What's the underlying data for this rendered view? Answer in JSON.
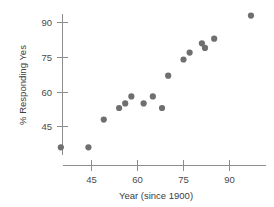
{
  "chart_data": {
    "type": "scatter",
    "title": "",
    "xlabel": "Year (since 1900)",
    "ylabel": "% Responding Yes",
    "xticks": [
      45,
      60,
      75,
      90
    ],
    "yticks": [
      45,
      60,
      75,
      90
    ],
    "xlim": [
      30,
      100
    ],
    "ylim": [
      30,
      97
    ],
    "grid": false,
    "legend": "none",
    "marker_color": "#6f6f6f",
    "axis_color": "#8d8d8d",
    "points": [
      {
        "x": 35,
        "y": 36
      },
      {
        "x": 44,
        "y": 36
      },
      {
        "x": 49,
        "y": 48
      },
      {
        "x": 54,
        "y": 53
      },
      {
        "x": 56,
        "y": 55
      },
      {
        "x": 58,
        "y": 58
      },
      {
        "x": 62,
        "y": 55
      },
      {
        "x": 65,
        "y": 58
      },
      {
        "x": 68,
        "y": 53
      },
      {
        "x": 70,
        "y": 67
      },
      {
        "x": 75,
        "y": 74
      },
      {
        "x": 77,
        "y": 77
      },
      {
        "x": 81,
        "y": 81
      },
      {
        "x": 82,
        "y": 79
      },
      {
        "x": 85,
        "y": 83
      },
      {
        "x": 97,
        "y": 93
      }
    ]
  },
  "axis_labels": {
    "x_title": "Year (since 1900)",
    "y_title": "% Responding Yes",
    "x_tick_texts": [
      "45",
      "60",
      "75",
      "90"
    ],
    "y_tick_texts": [
      "45",
      "60",
      "75",
      "90"
    ]
  }
}
